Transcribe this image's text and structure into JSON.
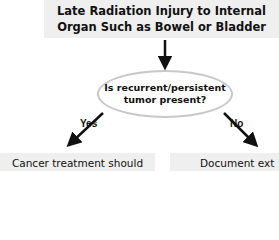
{
  "diagram": {
    "top_box": {
      "line1": "Late Radiation Injury to Internal",
      "line2": "Organ Such as Bowel or Bladder"
    },
    "decision": {
      "line1": "Is recurrent/persistent",
      "line2": "tumor present?"
    },
    "branches": {
      "yes_label": "Yes",
      "no_label": "No"
    },
    "bottom_left_box": {
      "text": "Cancer treatment should"
    },
    "bottom_right_box": {
      "text": "Document ext"
    },
    "colors": {
      "box_fill": "#efefef",
      "ellipse_stroke": "#c8c8c8",
      "arrow": "#111111"
    }
  }
}
